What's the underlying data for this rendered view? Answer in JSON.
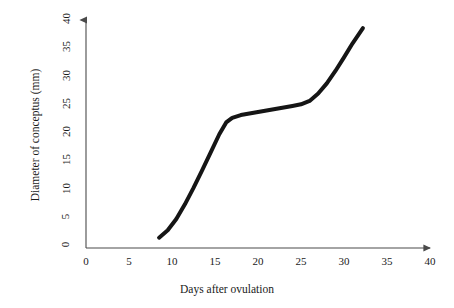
{
  "chart_data": {
    "type": "line",
    "title": "",
    "xlabel": "Days after ovulation",
    "ylabel": "Diameter of conceptus (mm)",
    "xlim": [
      0,
      40
    ],
    "ylim": [
      0,
      40
    ],
    "xticks": [
      "0",
      "5",
      "10",
      "15",
      "20",
      "25",
      "30",
      "35",
      "40"
    ],
    "yticks": [
      "0",
      "5",
      "10",
      "15",
      "20",
      "25",
      "30",
      "35",
      "40"
    ],
    "grid": false,
    "legend": "none",
    "series": [
      {
        "name": "Conceptus growth",
        "color": "#151515",
        "linewidth": 4,
        "x": [
          8.5,
          9.5,
          10.5,
          11.5,
          12.5,
          13.5,
          14.5,
          15.5,
          16.3,
          17.0,
          18.0,
          19.5,
          21.0,
          22.5,
          24.0,
          25.0,
          26.0,
          27.0,
          28.0,
          29.0,
          30.0,
          31.0,
          32.2
        ],
        "y": [
          1.3,
          2.6,
          4.6,
          7.2,
          10.1,
          13.2,
          16.4,
          19.6,
          21.7,
          22.5,
          23.0,
          23.4,
          23.8,
          24.2,
          24.6,
          24.9,
          25.5,
          26.8,
          28.6,
          30.8,
          33.2,
          35.7,
          38.4
        ]
      }
    ]
  },
  "axes": {
    "x_arrow": "arrow-right",
    "y_arrow": "arrow-up"
  }
}
